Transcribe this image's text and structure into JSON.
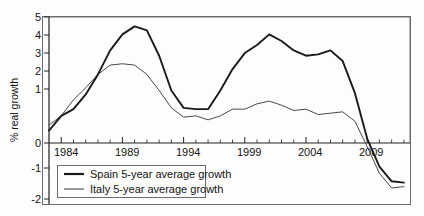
{
  "chart_data": {
    "type": "line",
    "title": "",
    "xlabel": "",
    "ylabel": "% real growth",
    "xlim": [
      1983.0,
      2012.5
    ],
    "ylim": [
      -2,
      5
    ],
    "grid": false,
    "legend_position": "bottom-left",
    "xticks": [
      "1984",
      "1989",
      "1994",
      "1999",
      "2004",
      "2009"
    ],
    "xtick_values": [
      1984,
      1989,
      1994,
      1999,
      2004,
      2009
    ],
    "yticks": [
      "-2",
      "-1",
      "0",
      "1",
      "2",
      "3",
      "4",
      "5"
    ],
    "ytick_values": [
      -2,
      -1,
      0,
      1,
      2,
      3,
      4,
      5
    ],
    "x": [
      1983,
      1984,
      1985,
      1986,
      1987,
      1988,
      1989,
      1990,
      1991,
      1992,
      1993,
      1994,
      1995,
      1996,
      1997,
      1998,
      1999,
      2000,
      2001,
      2002,
      2003,
      2004,
      2005,
      2006,
      2007,
      2008,
      2009,
      2010,
      2011,
      2012
    ],
    "series": [
      {
        "name": "Spain 5-year average growth",
        "label": "Spain 5-year average growth",
        "color": "#1a1a1a",
        "linewidth": 1.9,
        "values": [
          0.75,
          1.3,
          1.55,
          2.1,
          2.85,
          3.75,
          4.35,
          4.65,
          4.5,
          3.55,
          2.25,
          1.6,
          1.55,
          1.55,
          2.25,
          3.05,
          3.65,
          3.95,
          4.35,
          4.1,
          3.75,
          3.55,
          3.6,
          3.75,
          3.35,
          2.15,
          0.45,
          -0.6,
          -1.15,
          -1.2
        ]
      },
      {
        "name": "Italy 5-year average growth",
        "label": "Italy 5-year average growth",
        "color": "#4a4a4a",
        "linewidth": 1.0,
        "values": [
          0.95,
          1.3,
          1.9,
          2.35,
          2.85,
          3.2,
          3.25,
          3.2,
          2.85,
          2.25,
          1.6,
          1.25,
          1.3,
          1.15,
          1.3,
          1.55,
          1.55,
          1.75,
          1.85,
          1.7,
          1.5,
          1.55,
          1.35,
          1.4,
          1.45,
          1.1,
          0.15,
          -0.85,
          -1.4,
          -1.35
        ]
      }
    ]
  },
  "axis": {
    "ylabel": "% real growth"
  },
  "legend": {
    "items": [
      {
        "label": "Spain 5-year average growth"
      },
      {
        "label": "Italy 5-year average growth"
      }
    ]
  }
}
